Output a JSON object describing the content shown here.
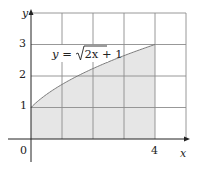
{
  "chart_data": {
    "type": "area",
    "title": "",
    "xlabel": "x",
    "ylabel": "y",
    "function": "y = sqrt(2x + 1)",
    "annotation": "y = √2x + 1",
    "x_ticks": [
      "0",
      "4"
    ],
    "y_ticks": [
      "1",
      "2",
      "3"
    ],
    "xlim": [
      0,
      5
    ],
    "ylim": [
      0,
      4
    ],
    "grid": true,
    "grid_step": 1,
    "shaded_region": {
      "x_from": 0,
      "x_to": 4,
      "under": "y = sqrt(2x+1)",
      "color": "#e6e6e6"
    },
    "x": [
      0,
      0.5,
      1,
      1.5,
      2,
      2.5,
      3,
      3.5,
      4
    ],
    "y": [
      1,
      1.414,
      1.732,
      2,
      2.236,
      2.449,
      2.646,
      2.828,
      3
    ]
  },
  "labels": {
    "x_axis": "x",
    "y_axis": "y",
    "origin": "0",
    "x4": "4",
    "y1": "1",
    "y2": "2",
    "y3": "3",
    "eq_prefix": "y = ",
    "eq_radicand": "2x + 1"
  },
  "colors": {
    "shade": "#e6e6e6",
    "grid": "#8c8c8c",
    "axis": "#222222",
    "curve": "#7a7a7a"
  }
}
